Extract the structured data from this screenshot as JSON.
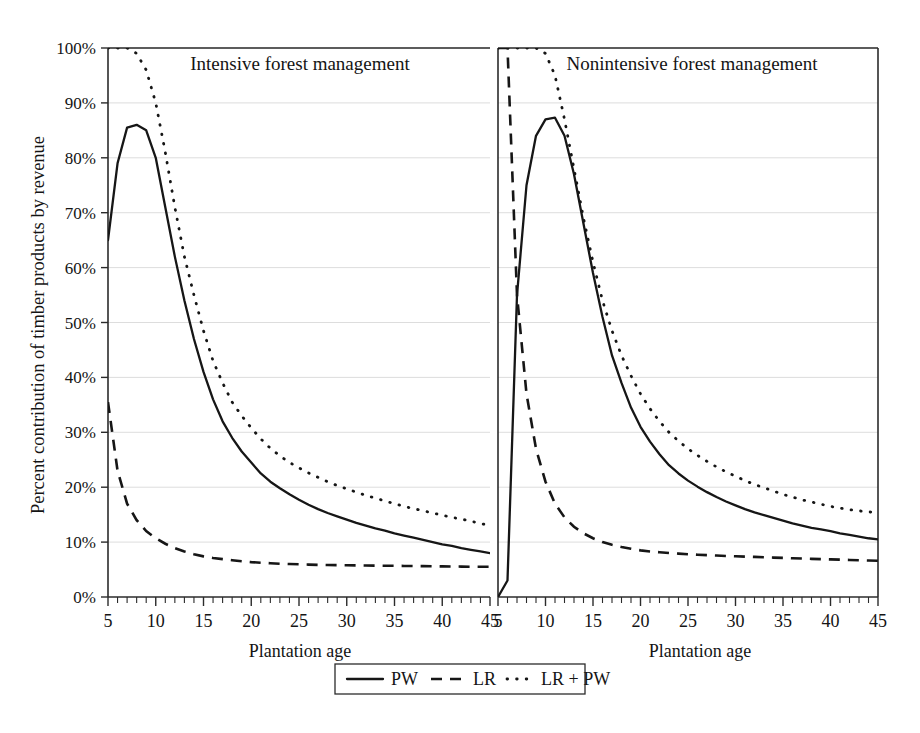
{
  "figure": {
    "y_axis_title": "Percent contribution of timber products by revenue",
    "x_axis_title_left": "Plantation age",
    "x_axis_title_right": "Plantation age",
    "panel_left_title": "Intensive forest management",
    "panel_right_title": "Nonintensive forest management",
    "y_ticks": [
      "0%",
      "10%",
      "20%",
      "30%",
      "40%",
      "50%",
      "60%",
      "70%",
      "80%",
      "90%",
      "100%"
    ],
    "x_ticks": [
      "5",
      "10",
      "15",
      "20",
      "25",
      "30",
      "35",
      "40",
      "45"
    ],
    "line_color": "#161616",
    "grid_color": "#cfcfcf"
  },
  "legend": {
    "items": [
      {
        "label": "PW",
        "style": "solid"
      },
      {
        "label": "LR",
        "style": "dashed"
      },
      {
        "label": "LR + PW",
        "style": "dotted"
      }
    ]
  },
  "chart_data": {
    "type": "line",
    "title": "",
    "xlabel": "Plantation age",
    "ylabel": "Percent contribution of timber products by revenue",
    "xlim": [
      5,
      45
    ],
    "ylim": [
      0,
      100
    ],
    "grid": true,
    "legend_position": "bottom-center",
    "panels": [
      {
        "name": "Intensive forest management",
        "x": [
          5,
          6,
          7,
          8,
          9,
          10,
          11,
          12,
          13,
          14,
          15,
          16,
          17,
          18,
          19,
          20,
          21,
          22,
          23,
          24,
          25,
          26,
          27,
          28,
          29,
          30,
          31,
          32,
          33,
          34,
          35,
          36,
          37,
          38,
          39,
          40,
          41,
          42,
          43,
          44,
          45
        ],
        "series": [
          {
            "name": "PW",
            "style": "solid",
            "values": [
              65,
              79,
              85.5,
              86,
              85,
              80,
              71,
              62,
              54,
              47,
              41,
              36,
              32,
              29,
              26.5,
              24.5,
              22.5,
              21,
              19.8,
              18.7,
              17.7,
              16.8,
              16,
              15.3,
              14.7,
              14.1,
              13.5,
              13,
              12.5,
              12.1,
              11.6,
              11.2,
              10.8,
              10.4,
              10,
              9.6,
              9.3,
              8.9,
              8.6,
              8.3,
              8
            ]
          },
          {
            "name": "LR",
            "style": "dashed",
            "values": [
              35.5,
              23,
              17,
              14,
              12,
              10.7,
              9.7,
              8.9,
              8.3,
              7.8,
              7.4,
              7.1,
              6.9,
              6.7,
              6.5,
              6.35,
              6.25,
              6.15,
              6.05,
              6,
              5.95,
              5.9,
              5.85,
              5.82,
              5.8,
              5.78,
              5.76,
              5.74,
              5.72,
              5.7,
              5.68,
              5.66,
              5.64,
              5.62,
              5.6,
              5.58,
              5.56,
              5.54,
              5.52,
              5.51,
              5.5
            ]
          },
          {
            "name": "LR + PW",
            "style": "dotted",
            "values": [
              100,
              100,
              100,
              99,
              96,
              90,
              81,
              71,
              62,
              55,
              48.5,
              43,
              39,
              35.5,
              33,
              30.8,
              28.8,
              27.1,
              25.7,
              24.5,
              23.5,
              22.6,
              21.8,
              21,
              20.3,
              19.7,
              19.1,
              18.5,
              18,
              17.5,
              17,
              16.5,
              16.1,
              15.7,
              15.3,
              14.9,
              14.5,
              14.2,
              13.8,
              13.4,
              13
            ]
          }
        ]
      },
      {
        "name": "Nonintensive forest management",
        "x": [
          5,
          6,
          7,
          8,
          9,
          10,
          11,
          12,
          13,
          14,
          15,
          16,
          17,
          18,
          19,
          20,
          21,
          22,
          23,
          24,
          25,
          26,
          27,
          28,
          29,
          30,
          31,
          32,
          33,
          34,
          35,
          36,
          37,
          38,
          39,
          40,
          41,
          42,
          43,
          44,
          45
        ],
        "series": [
          {
            "name": "PW",
            "style": "solid",
            "values": [
              0,
              3,
              55,
              75,
              84,
              87,
              87.3,
              84,
              77,
              68,
              59,
              51,
              44,
              39,
              34.5,
              31,
              28.3,
              26,
              24,
              22.5,
              21.2,
              20.1,
              19.1,
              18.2,
              17.4,
              16.7,
              16,
              15.4,
              14.9,
              14.4,
              13.9,
              13.4,
              13,
              12.6,
              12.3,
              12,
              11.6,
              11.3,
              11,
              10.7,
              10.5
            ]
          },
          {
            "name": "LR",
            "style": "dashed",
            "values": [
              100,
              100,
              55,
              37,
              27,
              21,
              17,
              14.5,
              12.8,
              11.6,
              10.7,
              10,
              9.5,
              9.1,
              8.8,
              8.5,
              8.3,
              8.15,
              8,
              7.9,
              7.8,
              7.7,
              7.62,
              7.55,
              7.48,
              7.42,
              7.36,
              7.3,
              7.24,
              7.18,
              7.12,
              7.06,
              7,
              6.95,
              6.9,
              6.85,
              6.8,
              6.75,
              6.7,
              6.65,
              6.6
            ]
          },
          {
            "name": "LR + PW",
            "style": "dotted",
            "values": [
              100,
              100,
              100,
              100,
              100,
              99,
              95,
              87,
              78,
              69,
              61,
              54,
              48.5,
              44,
              40.3,
              37,
              34.3,
              32,
              30,
              28.4,
              27,
              25.8,
              24.7,
              23.7,
              22.8,
              22,
              21.2,
              20.5,
              19.9,
              19.3,
              18.7,
              18.2,
              17.7,
              17.3,
              16.9,
              16.5,
              16.2,
              15.9,
              15.7,
              15.5,
              15.4
            ]
          }
        ]
      }
    ]
  }
}
